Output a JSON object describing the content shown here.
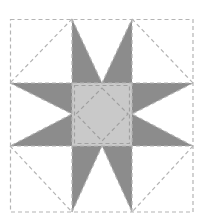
{
  "diagram": {
    "type": "quilt-block",
    "pattern": "eight-point-star",
    "grid": {
      "x": [
        10,
        72,
        132,
        193
      ],
      "y": [
        19,
        83,
        146,
        212
      ]
    },
    "colors": {
      "background": "#ffffff",
      "star_points": "#8c8c8c",
      "center": "#c9c9c9",
      "seam_lines": "#b4b4b4"
    },
    "pieces": {
      "corners": [
        {
          "name": "top-left",
          "diagonal": [
            [
              72,
              19
            ],
            [
              10,
              83
            ]
          ]
        },
        {
          "name": "top-right",
          "diagonal": [
            [
              132,
              19
            ],
            [
              193,
              83
            ]
          ]
        },
        {
          "name": "bottom-left",
          "diagonal": [
            [
              10,
              146
            ],
            [
              72,
              212
            ]
          ]
        },
        {
          "name": "bottom-right",
          "diagonal": [
            [
              193,
              146
            ],
            [
              132,
              212
            ]
          ]
        }
      ],
      "center_diamond": [
        [
          102,
          88
        ],
        [
          128,
          114
        ],
        [
          102,
          141
        ],
        [
          76,
          114
        ]
      ]
    }
  }
}
